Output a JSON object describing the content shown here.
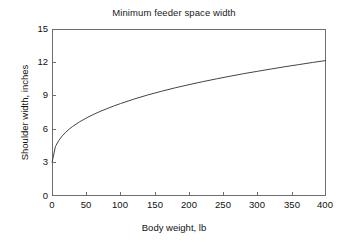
{
  "chart_data": {
    "type": "line",
    "title": "Minimum feeder space width",
    "xlabel": "Body weight, lb",
    "ylabel": "Shoulder width, inches",
    "xlim": [
      0,
      400
    ],
    "ylim": [
      0,
      15
    ],
    "xticks": [
      "0",
      "50",
      "100",
      "150",
      "200",
      "250",
      "300",
      "350",
      "400"
    ],
    "xtick_values": [
      0,
      50,
      100,
      150,
      200,
      250,
      300,
      350,
      400
    ],
    "yticks": [
      "0",
      "3",
      "6",
      "9",
      "12",
      "15"
    ],
    "ytick_values": [
      0,
      3,
      6,
      9,
      12,
      15
    ],
    "grid": false,
    "legend": "none",
    "series": [
      {
        "name": "Shoulder width",
        "color": "#444444",
        "x": [
          0,
          5,
          10,
          15,
          20,
          25,
          30,
          40,
          50,
          60,
          70,
          80,
          90,
          100,
          120,
          140,
          160,
          180,
          200,
          220,
          240,
          260,
          280,
          300,
          320,
          340,
          360,
          380,
          400
        ],
        "values": [
          3.0,
          4.45,
          5.0,
          5.4,
          5.72,
          6.0,
          6.24,
          6.65,
          7.0,
          7.31,
          7.59,
          7.84,
          8.08,
          8.3,
          8.71,
          9.08,
          9.41,
          9.72,
          10.0,
          10.27,
          10.52,
          10.76,
          10.99,
          11.2,
          11.41,
          11.61,
          11.8,
          11.99,
          12.17
        ]
      }
    ]
  },
  "axes": {
    "ytick_labels": [
      "15",
      "12",
      "9",
      "6",
      "3",
      "0"
    ],
    "xtick_labels": [
      "0",
      "50",
      "100",
      "150",
      "200",
      "250",
      "300",
      "350",
      "400"
    ]
  }
}
